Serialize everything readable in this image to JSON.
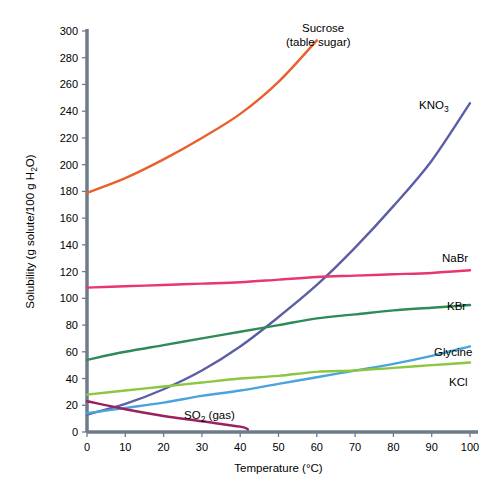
{
  "chart_data": {
    "type": "line",
    "title": "",
    "xlabel": "Temperature (°C)",
    "ylabel": "Solubility (g solute/100 g H₂O)",
    "xlim": [
      0,
      100
    ],
    "ylim": [
      0,
      300
    ],
    "xticks": [
      0,
      10,
      20,
      30,
      40,
      50,
      60,
      70,
      80,
      90,
      100
    ],
    "yticks": [
      0,
      20,
      40,
      60,
      80,
      100,
      120,
      140,
      160,
      180,
      200,
      220,
      240,
      260,
      280,
      300
    ],
    "grid": false,
    "legend_position": "inline-annotations",
    "series": [
      {
        "name": "Sucrose",
        "label": "Sucrose",
        "label_line2": "(table sugar)",
        "color": "#E8602C",
        "x": [
          0,
          10,
          20,
          30,
          40,
          50,
          60
        ],
        "values": [
          179,
          190,
          204,
          220,
          238,
          262,
          293
        ]
      },
      {
        "name": "KNO3",
        "label": "KNO",
        "label_sub": "3",
        "color": "#5B5EA6",
        "x": [
          0,
          10,
          20,
          30,
          40,
          50,
          60,
          70,
          80,
          90,
          100
        ],
        "values": [
          13,
          21,
          32,
          46,
          64,
          86,
          110,
          138,
          169,
          203,
          246
        ]
      },
      {
        "name": "NaBr",
        "label": "NaBr",
        "color": "#E8366F",
        "x": [
          0,
          10,
          20,
          30,
          40,
          50,
          60,
          70,
          80,
          90,
          100
        ],
        "values": [
          108,
          109,
          110,
          111,
          112,
          114,
          116,
          117,
          118,
          119,
          121
        ]
      },
      {
        "name": "KBr",
        "label": "KBr",
        "color": "#2E8B57",
        "x": [
          0,
          10,
          20,
          30,
          40,
          50,
          60,
          70,
          80,
          90,
          100
        ],
        "values": [
          54,
          60,
          65,
          70,
          75,
          80,
          85,
          88,
          91,
          93,
          95
        ]
      },
      {
        "name": "Glycine",
        "label": "Glycine",
        "color": "#4BA3DC",
        "x": [
          0,
          10,
          20,
          30,
          40,
          50,
          60,
          70,
          80,
          90,
          100
        ],
        "values": [
          14,
          18,
          22,
          27,
          31,
          36,
          41,
          46,
          51,
          57,
          64
        ]
      },
      {
        "name": "KCl",
        "label": "KCl",
        "color": "#8DC63F",
        "x": [
          0,
          10,
          20,
          30,
          40,
          50,
          60,
          70,
          80,
          90,
          100
        ],
        "values": [
          28,
          31,
          34,
          37,
          40,
          42,
          45,
          46,
          48,
          50,
          52
        ]
      },
      {
        "name": "SO2",
        "label": "SO",
        "label_sub": "2",
        "label_suffix": " (gas)",
        "color": "#9B2060",
        "x": [
          0,
          10,
          20,
          30,
          40,
          42
        ],
        "values": [
          23,
          17,
          12,
          8,
          4,
          2
        ]
      }
    ],
    "annotations": [
      {
        "id": "sucrose-label",
        "text_line1": "Sucrose",
        "text_line2": "(table sugar)",
        "x_px": 302,
        "y_px": 32
      },
      {
        "id": "kno3-label",
        "text": "KNO",
        "sub": "3",
        "x_px": 419,
        "y_px": 109
      },
      {
        "id": "nabr-label",
        "text": "NaBr",
        "x_px": 442,
        "y_px": 262
      },
      {
        "id": "kbr-label",
        "text": "KBr",
        "x_px": 447,
        "y_px": 310
      },
      {
        "id": "glycine-label",
        "text": "Glycine",
        "x_px": 434,
        "y_px": 356
      },
      {
        "id": "kcl-label",
        "text": "KCl",
        "x_px": 449,
        "y_px": 386
      },
      {
        "id": "so2-label",
        "text": "SO",
        "sub": "2",
        "suffix": " (gas)",
        "x_px": 184,
        "y_px": 419
      }
    ]
  },
  "axes": {
    "x_axis_title": "Temperature (°C)",
    "y_axis_title": "Solubility (g solute/100 g H₂O)",
    "axis_color": "#6E7B8B"
  }
}
